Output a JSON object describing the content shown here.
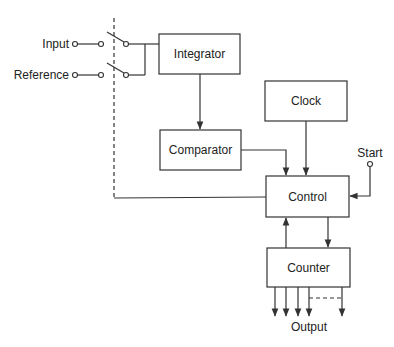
{
  "diagram": {
    "type": "block-diagram",
    "inputs": {
      "input_label": "Input",
      "reference_label": "Reference",
      "start_label": "Start"
    },
    "blocks": {
      "integrator": "Integrator",
      "comparator": "Comparator",
      "clock": "Clock",
      "control": "Control",
      "counter": "Counter"
    },
    "outputs": {
      "output_label": "Output"
    },
    "connections": [
      {
        "from": "Input",
        "to": "Integrator",
        "via": "switch"
      },
      {
        "from": "Reference",
        "to": "Integrator",
        "via": "switch"
      },
      {
        "from": "Integrator",
        "to": "Comparator"
      },
      {
        "from": "Comparator",
        "to": "Control"
      },
      {
        "from": "Clock",
        "to": "Control"
      },
      {
        "from": "Start",
        "to": "Control"
      },
      {
        "from": "Control",
        "to": "Switches",
        "style": "dashed"
      },
      {
        "from": "Control",
        "to": "Counter"
      },
      {
        "from": "Counter",
        "to": "Control"
      },
      {
        "from": "Counter",
        "to": "Output"
      }
    ]
  }
}
